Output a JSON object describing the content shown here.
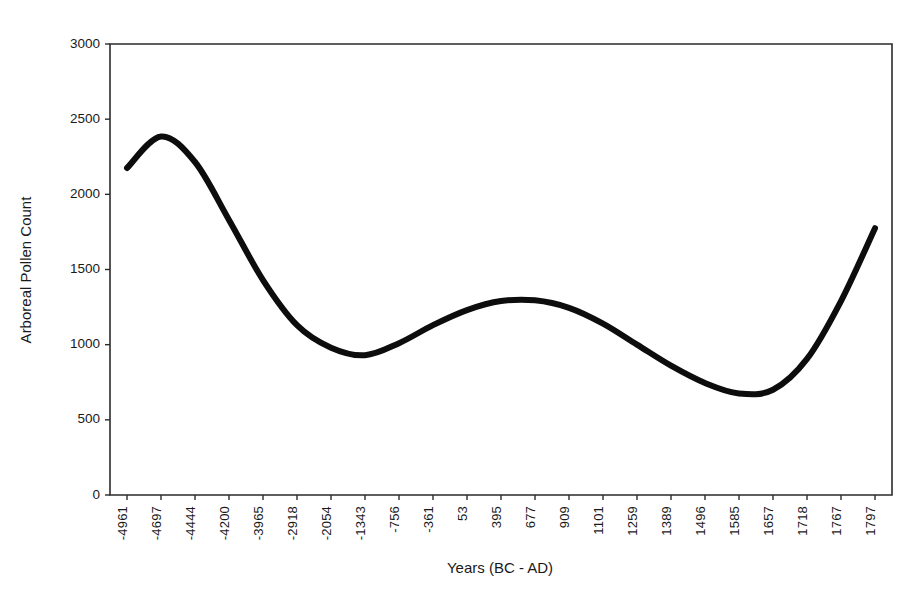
{
  "chart_data": {
    "type": "line",
    "title": "",
    "xlabel": "Years (BC - AD)",
    "ylabel": "Arboreal Pollen Count",
    "grid": false,
    "legend": false,
    "line_color": "#0d0d0d",
    "line_width": 6,
    "axis_color": "#2b2b2b",
    "background": "#ffffff",
    "ylim": [
      0,
      3000
    ],
    "ytick_labels": [
      "0",
      "500",
      "1000",
      "1500",
      "2000",
      "2500",
      "3000"
    ],
    "ytick_values": [
      0,
      500,
      1000,
      1500,
      2000,
      2500,
      3000
    ],
    "categories": [
      "-4961",
      "-4697",
      "-4444",
      "-4200",
      "-3965",
      "-2918",
      "-2054",
      "-1343",
      "-756",
      "-361",
      "53",
      "395",
      "677",
      "909",
      "1101",
      "1259",
      "1389",
      "1496",
      "1585",
      "1657",
      "1718",
      "1767",
      "1797"
    ],
    "values": [
      2175,
      2385,
      2215,
      1830,
      1430,
      1130,
      980,
      930,
      1010,
      1130,
      1230,
      1290,
      1295,
      1245,
      1140,
      1000,
      860,
      745,
      675,
      700,
      905,
      1290,
      1775
    ]
  }
}
